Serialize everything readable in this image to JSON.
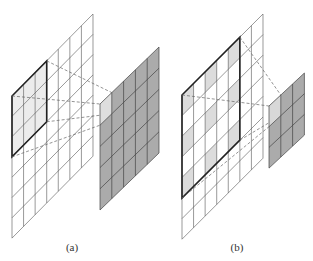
{
  "figure": {
    "panels": [
      {
        "id": "a",
        "caption": "(a)",
        "caption_pos": [
          72,
          243
        ],
        "description": "Standard 3x3 convolution on 7x7 input producing 5x5 output",
        "input_grid": {
          "cols": 7,
          "rows": 7,
          "origin": [
            12,
            96
          ],
          "col_dx": 11.57,
          "col_dy": -11.71,
          "row_dy": 20.3,
          "window": {
            "col": 0,
            "row": 0,
            "size": 3
          },
          "shaded_cells": [
            [
              0,
              0
            ],
            [
              1,
              0
            ],
            [
              2,
              0
            ],
            [
              0,
              1
            ],
            [
              1,
              1
            ],
            [
              2,
              1
            ],
            [
              0,
              2
            ],
            [
              1,
              2
            ],
            [
              2,
              2
            ]
          ],
          "shade_color": "#ececec"
        },
        "output_grid": {
          "cols": 5,
          "rows": 5,
          "origin": [
            100,
            104
          ],
          "col_dx": 11.8,
          "col_dy": -11.4,
          "row_dy": 21.2,
          "fill": "#ababab",
          "highlight_cell": [
            0,
            0
          ],
          "highlight_color": "#dedede"
        }
      },
      {
        "id": "b",
        "caption": "(b)",
        "caption_pos": [
          237,
          243
        ],
        "description": "Dilated 3x3 convolution (dilation 2) on 7x7 input producing 3x3 output",
        "input_grid": {
          "cols": 7,
          "rows": 7,
          "origin": [
            182,
            95
          ],
          "col_dx": 11.57,
          "col_dy": -11.57,
          "row_dy": 20.6,
          "window": {
            "col": 0,
            "row": 0,
            "size": 5
          },
          "shaded_cells": [
            [
              0,
              0
            ],
            [
              2,
              0
            ],
            [
              4,
              0
            ],
            [
              0,
              2
            ],
            [
              2,
              2
            ],
            [
              4,
              2
            ],
            [
              0,
              4
            ],
            [
              2,
              4
            ],
            [
              4,
              4
            ]
          ],
          "shade_color": "#dcdcdc"
        },
        "output_grid": {
          "cols": 3,
          "rows": 3,
          "origin": [
            269,
            106
          ],
          "col_dx": 11.8,
          "col_dy": -11.0,
          "row_dy": 20.7,
          "fill": "#ababab",
          "highlight_cell": [
            0,
            0
          ],
          "highlight_color": "#d8d8d8"
        }
      }
    ],
    "colors": {
      "grid_line": "#555555",
      "window_border": "#222222",
      "dashed_line": "#666666",
      "background": "#ffffff"
    }
  }
}
